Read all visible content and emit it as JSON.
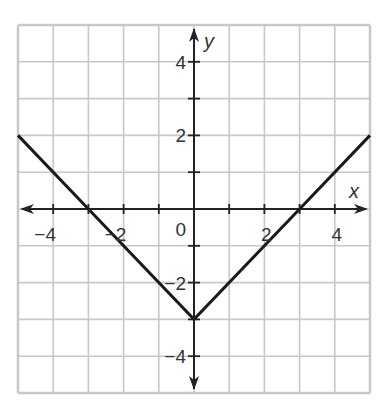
{
  "chart_data": {
    "type": "line",
    "title": "",
    "function": "y = |x| - 3",
    "xlabel": "x",
    "ylabel": "y",
    "xlim": [
      -5,
      5
    ],
    "ylim": [
      -5,
      5
    ],
    "grid": true,
    "x_ticks": [
      -4,
      -2,
      0,
      2,
      4
    ],
    "y_ticks": [
      4,
      2,
      -2,
      -4
    ],
    "x_tick_labels": [
      "−4",
      "−2",
      "0",
      "2",
      "4"
    ],
    "y_tick_labels": [
      "4",
      "2",
      "−2",
      "−4"
    ],
    "origin_label": "0",
    "series": [
      {
        "name": "y = |x| - 3",
        "points": [
          [
            -5,
            2
          ],
          [
            -3,
            0
          ],
          [
            0,
            -3
          ],
          [
            3,
            0
          ],
          [
            5,
            2
          ]
        ]
      }
    ],
    "vertex": [
      0,
      -3
    ],
    "x_intercepts": [
      -3,
      3
    ],
    "colors": {
      "grid": "#c8c8c8",
      "axis": "#222222",
      "line": "#1a1a1a",
      "text": "#333333"
    }
  }
}
